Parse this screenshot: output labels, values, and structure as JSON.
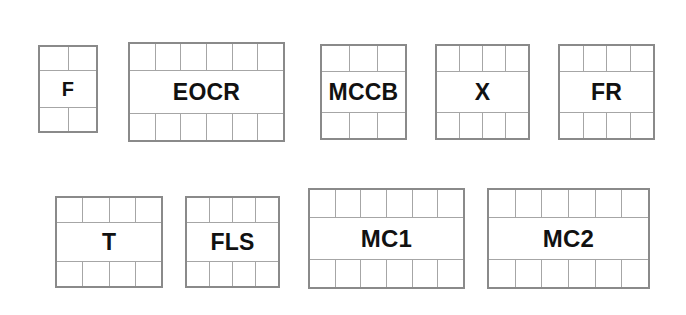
{
  "canvas": {
    "width": 686,
    "height": 315,
    "background": "#ffffff",
    "outer_border_color": "#8a8a8a",
    "inner_line_color": "#a6a6a6",
    "label_color": "#111111"
  },
  "blocks": [
    {
      "id": "f",
      "label": "F",
      "columns": 2,
      "x": 38,
      "y": 45,
      "width": 60,
      "height": 88,
      "top_row_height": 24,
      "bottom_row_height": 24,
      "font_size": 20
    },
    {
      "id": "eocr",
      "label": "EOCR",
      "columns": 6,
      "x": 128,
      "y": 42,
      "width": 157,
      "height": 100,
      "top_row_height": 27,
      "bottom_row_height": 27,
      "font_size": 23
    },
    {
      "id": "mccb",
      "label": "MCCB",
      "columns": 3,
      "x": 320,
      "y": 44,
      "width": 87,
      "height": 96,
      "top_row_height": 26,
      "bottom_row_height": 26,
      "font_size": 23
    },
    {
      "id": "x",
      "label": "X",
      "columns": 4,
      "x": 435,
      "y": 44,
      "width": 95,
      "height": 96,
      "top_row_height": 26,
      "bottom_row_height": 26,
      "font_size": 23
    },
    {
      "id": "fr",
      "label": "FR",
      "columns": 4,
      "x": 558,
      "y": 44,
      "width": 97,
      "height": 96,
      "top_row_height": 26,
      "bottom_row_height": 26,
      "font_size": 23
    },
    {
      "id": "t",
      "label": "T",
      "columns": 4,
      "x": 55,
      "y": 196,
      "width": 108,
      "height": 92,
      "top_row_height": 25,
      "bottom_row_height": 25,
      "font_size": 23
    },
    {
      "id": "fls",
      "label": "FLS",
      "columns": 4,
      "x": 185,
      "y": 196,
      "width": 95,
      "height": 92,
      "top_row_height": 25,
      "bottom_row_height": 25,
      "font_size": 23
    },
    {
      "id": "mc1",
      "label": "MC1",
      "columns": 6,
      "x": 308,
      "y": 188,
      "width": 157,
      "height": 101,
      "top_row_height": 28,
      "bottom_row_height": 28,
      "font_size": 24
    },
    {
      "id": "mc2",
      "label": "MC2",
      "columns": 6,
      "x": 487,
      "y": 188,
      "width": 163,
      "height": 101,
      "top_row_height": 28,
      "bottom_row_height": 28,
      "font_size": 24
    }
  ]
}
